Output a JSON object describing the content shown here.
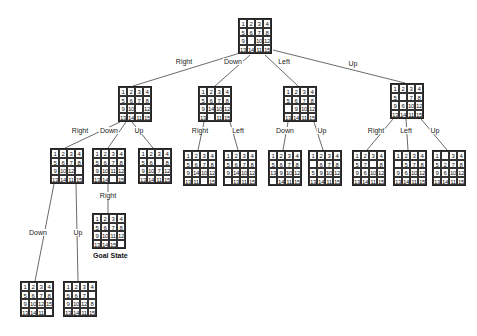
{
  "diagram": {
    "type": "15-puzzle search tree",
    "goal_label": "Goal State",
    "nodes": [
      {
        "id": "root",
        "x": 238,
        "y": 18,
        "tiles": [
          [
            1,
            2,
            3,
            4
          ],
          [
            5,
            6,
            7,
            8
          ],
          [
            9,
            "",
            10,
            12
          ],
          [
            13,
            14,
            11,
            15
          ]
        ]
      },
      {
        "id": "R",
        "x": 118,
        "y": 86,
        "tiles": [
          [
            1,
            2,
            3,
            4
          ],
          [
            5,
            6,
            7,
            8
          ],
          [
            9,
            10,
            "",
            12
          ],
          [
            13,
            14,
            11,
            15
          ]
        ]
      },
      {
        "id": "D",
        "x": 198,
        "y": 86,
        "tiles": [
          [
            1,
            2,
            3,
            4
          ],
          [
            5,
            6,
            7,
            8
          ],
          [
            9,
            14,
            10,
            12
          ],
          [
            13,
            "",
            11,
            15
          ]
        ]
      },
      {
        "id": "L",
        "x": 283,
        "y": 86,
        "tiles": [
          [
            1,
            2,
            3,
            4
          ],
          [
            5,
            6,
            7,
            8
          ],
          [
            "",
            9,
            10,
            12
          ],
          [
            13,
            14,
            11,
            15
          ]
        ]
      },
      {
        "id": "U",
        "x": 390,
        "y": 83,
        "tiles": [
          [
            1,
            2,
            3,
            4
          ],
          [
            5,
            "",
            7,
            8
          ],
          [
            9,
            6,
            10,
            12
          ],
          [
            13,
            14,
            11,
            15
          ]
        ]
      },
      {
        "id": "RR",
        "x": 50,
        "y": 148,
        "tiles": [
          [
            1,
            2,
            3,
            4
          ],
          [
            5,
            6,
            7,
            8
          ],
          [
            9,
            10,
            12,
            ""
          ],
          [
            13,
            14,
            11,
            15
          ]
        ]
      },
      {
        "id": "RD",
        "x": 92,
        "y": 148,
        "tiles": [
          [
            1,
            2,
            3,
            4
          ],
          [
            5,
            6,
            7,
            8
          ],
          [
            9,
            10,
            11,
            12
          ],
          [
            13,
            14,
            "",
            15
          ]
        ]
      },
      {
        "id": "RU",
        "x": 138,
        "y": 148,
        "tiles": [
          [
            1,
            2,
            3,
            4
          ],
          [
            5,
            6,
            "",
            8
          ],
          [
            9,
            10,
            7,
            12
          ],
          [
            13,
            14,
            11,
            15
          ]
        ]
      },
      {
        "id": "DR",
        "x": 183,
        "y": 150,
        "tiles": [
          [
            1,
            2,
            3,
            4
          ],
          [
            5,
            6,
            7,
            8
          ],
          [
            9,
            14,
            10,
            12
          ],
          [
            13,
            11,
            "",
            15
          ]
        ]
      },
      {
        "id": "DL",
        "x": 223,
        "y": 150,
        "tiles": [
          [
            1,
            2,
            3,
            4
          ],
          [
            5,
            6,
            7,
            8
          ],
          [
            9,
            14,
            10,
            12
          ],
          [
            "",
            13,
            11,
            15
          ]
        ]
      },
      {
        "id": "LD",
        "x": 268,
        "y": 150,
        "tiles": [
          [
            1,
            2,
            3,
            4
          ],
          [
            5,
            6,
            7,
            8
          ],
          [
            13,
            9,
            10,
            12
          ],
          [
            "",
            14,
            11,
            15
          ]
        ]
      },
      {
        "id": "LU",
        "x": 308,
        "y": 150,
        "tiles": [
          [
            1,
            2,
            3,
            4
          ],
          [
            "",
            6,
            7,
            8
          ],
          [
            5,
            9,
            10,
            12
          ],
          [
            13,
            14,
            11,
            15
          ]
        ]
      },
      {
        "id": "UR",
        "x": 352,
        "y": 150,
        "tiles": [
          [
            1,
            2,
            3,
            4
          ],
          [
            5,
            7,
            "",
            8
          ],
          [
            9,
            6,
            10,
            12
          ],
          [
            13,
            14,
            11,
            15
          ]
        ]
      },
      {
        "id": "UL",
        "x": 393,
        "y": 150,
        "tiles": [
          [
            1,
            2,
            3,
            4
          ],
          [
            "",
            5,
            7,
            8
          ],
          [
            9,
            6,
            10,
            12
          ],
          [
            13,
            14,
            11,
            15
          ]
        ]
      },
      {
        "id": "UU",
        "x": 432,
        "y": 150,
        "tiles": [
          [
            1,
            "",
            3,
            4
          ],
          [
            5,
            2,
            7,
            8
          ],
          [
            9,
            6,
            10,
            12
          ],
          [
            13,
            14,
            11,
            15
          ]
        ]
      },
      {
        "id": "RDR",
        "x": 92,
        "y": 213,
        "tiles": [
          [
            1,
            2,
            3,
            4
          ],
          [
            5,
            6,
            7,
            8
          ],
          [
            9,
            10,
            11,
            12
          ],
          [
            13,
            14,
            15,
            ""
          ]
        ]
      },
      {
        "id": "RRD",
        "x": 20,
        "y": 281,
        "tiles": [
          [
            1,
            2,
            3,
            4
          ],
          [
            5,
            6,
            7,
            8
          ],
          [
            9,
            10,
            12,
            15
          ],
          [
            13,
            14,
            11,
            ""
          ]
        ]
      },
      {
        "id": "RRU",
        "x": 63,
        "y": 281,
        "tiles": [
          [
            1,
            2,
            3,
            4
          ],
          [
            5,
            6,
            7,
            ""
          ],
          [
            9,
            10,
            12,
            8
          ],
          [
            13,
            14,
            11,
            15
          ]
        ]
      }
    ],
    "edges": [
      {
        "from": "root",
        "to": "R",
        "label": "Right",
        "lx": 184,
        "ly": 62,
        "x1": 240,
        "y1": 53,
        "x2": 133,
        "y2": 86
      },
      {
        "from": "root",
        "to": "D",
        "label": "Down",
        "lx": 233,
        "ly": 62,
        "x1": 250,
        "y1": 55,
        "x2": 215,
        "y2": 86
      },
      {
        "from": "root",
        "to": "L",
        "label": "Left",
        "lx": 284,
        "ly": 62,
        "x1": 265,
        "y1": 55,
        "x2": 298,
        "y2": 86
      },
      {
        "from": "root",
        "to": "U",
        "label": "Up",
        "lx": 353,
        "ly": 64,
        "x1": 273,
        "y1": 50,
        "x2": 405,
        "y2": 83
      },
      {
        "from": "R",
        "to": "RR",
        "label": "Right",
        "lx": 80,
        "ly": 131,
        "x1": 120,
        "y1": 122,
        "x2": 65,
        "y2": 148
      },
      {
        "from": "R",
        "to": "RD",
        "label": "Down",
        "lx": 109,
        "ly": 131,
        "x1": 126,
        "y1": 122,
        "x2": 108,
        "y2": 148
      },
      {
        "from": "R",
        "to": "RU",
        "label": "Up",
        "lx": 139,
        "ly": 131,
        "x1": 132,
        "y1": 122,
        "x2": 153,
        "y2": 148
      },
      {
        "from": "RD",
        "to": "RDR",
        "label": "Right",
        "lx": 108,
        "ly": 196,
        "x1": 108,
        "y1": 184,
        "x2": 108,
        "y2": 213
      },
      {
        "from": "D",
        "to": "DR",
        "label": "Right",
        "lx": 200,
        "ly": 131,
        "x1": 204,
        "y1": 122,
        "x2": 198,
        "y2": 150
      },
      {
        "from": "D",
        "to": "DL",
        "label": "Left",
        "lx": 238,
        "ly": 131,
        "x1": 230,
        "y1": 122,
        "x2": 238,
        "y2": 150
      },
      {
        "from": "L",
        "to": "LD",
        "label": "Down",
        "lx": 285,
        "ly": 131,
        "x1": 288,
        "y1": 122,
        "x2": 283,
        "y2": 150
      },
      {
        "from": "L",
        "to": "LU",
        "label": "Up",
        "lx": 322,
        "ly": 131,
        "x1": 314,
        "y1": 122,
        "x2": 323,
        "y2": 150
      },
      {
        "from": "U",
        "to": "UR",
        "label": "Right",
        "lx": 376,
        "ly": 131,
        "x1": 393,
        "y1": 119,
        "x2": 367,
        "y2": 150
      },
      {
        "from": "U",
        "to": "UL",
        "label": "Left",
        "lx": 406,
        "ly": 131,
        "x1": 406,
        "y1": 119,
        "x2": 408,
        "y2": 150
      },
      {
        "from": "U",
        "to": "UU",
        "label": "Up",
        "lx": 435,
        "ly": 131,
        "x1": 421,
        "y1": 119,
        "x2": 447,
        "y2": 150
      },
      {
        "from": "RR",
        "to": "RRD",
        "label": "Down",
        "lx": 38,
        "ly": 233,
        "x1": 54,
        "y1": 184,
        "x2": 35,
        "y2": 281
      },
      {
        "from": "RR",
        "to": "RRU",
        "label": "Up",
        "lx": 78,
        "ly": 233,
        "x1": 76,
        "y1": 184,
        "x2": 78,
        "y2": 281
      }
    ],
    "goal_label_pos": {
      "x": 93,
      "y": 252
    }
  }
}
